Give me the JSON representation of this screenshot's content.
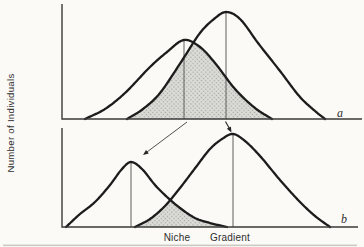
{
  "figure": {
    "y_axis_label": "Number of Individuals",
    "x_axis_words": [
      "Niche",
      "Gradient"
    ]
  },
  "colors": {
    "background": "#fbfaf7",
    "curve": "#1c1c1c",
    "axis": "#3a3a3a",
    "peak_line": "#4f4f4f",
    "shade_base": "#dcdcd8",
    "shade_dot": "#a6a6a0",
    "arrow": "#262626",
    "text": "#2e2e2e",
    "scan_edge": "#97958f"
  },
  "chart_data": [
    {
      "panel_label": "a",
      "type": "area",
      "xlabel": "Niche Gradient",
      "ylabel": "Number of Individuals",
      "axis_ticks": "none (qualitative axes)",
      "axes": {
        "x": 62,
        "y_top": 4,
        "baseline": 119,
        "x_end": 362
      },
      "series": [
        {
          "name": "species-1-curve",
          "points": [
            [
              85,
              0
            ],
            [
              105,
              10
            ],
            [
              125,
              26
            ],
            [
              150,
              52
            ],
            [
              167,
              67
            ],
            [
              184,
              79
            ],
            [
              200,
              72
            ],
            [
              215,
              56
            ],
            [
              235,
              30
            ],
            [
              255,
              11
            ],
            [
              272,
              0
            ]
          ],
          "peak": [
            184,
            79
          ]
        },
        {
          "name": "species-2-curve",
          "points": [
            [
              127,
              0
            ],
            [
              143,
              10
            ],
            [
              160,
              26
            ],
            [
              183,
              60
            ],
            [
              200,
              86
            ],
            [
              214,
              100
            ],
            [
              226,
              107
            ],
            [
              240,
              100
            ],
            [
              258,
              76
            ],
            [
              280,
              48
            ],
            [
              300,
              22
            ],
            [
              315,
              8
            ],
            [
              325,
              0
            ]
          ],
          "peak": [
            226,
            107
          ]
        }
      ],
      "overlap_shaded": true,
      "label_pos": [
        337,
        117
      ]
    },
    {
      "panel_label": "b",
      "type": "area",
      "xlabel": "Niche Gradient",
      "ylabel": "Number of Individuals",
      "axis_ticks": "none (qualitative axes)",
      "axes": {
        "x": 62,
        "y_top": 128,
        "baseline": 227,
        "x_end": 358
      },
      "series": [
        {
          "name": "species-1-curve",
          "points": [
            [
              66,
              0
            ],
            [
              80,
              13
            ],
            [
              95,
              25
            ],
            [
              110,
              42
            ],
            [
              122,
              58
            ],
            [
              131,
              65
            ],
            [
              142,
              58
            ],
            [
              155,
              42
            ],
            [
              167,
              30
            ],
            [
              180,
              19
            ],
            [
              195,
              9
            ],
            [
              210,
              4
            ],
            [
              227,
              0
            ]
          ],
          "peak": [
            131,
            65
          ]
        },
        {
          "name": "species-2-curve",
          "points": [
            [
              135,
              0
            ],
            [
              150,
              8
            ],
            [
              165,
              21
            ],
            [
              180,
              39
            ],
            [
              196,
              60
            ],
            [
              210,
              78
            ],
            [
              222,
              88
            ],
            [
              233,
              93
            ],
            [
              245,
              86
            ],
            [
              260,
              71
            ],
            [
              280,
              47
            ],
            [
              300,
              25
            ],
            [
              315,
              11
            ],
            [
              330,
              0
            ]
          ],
          "peak": [
            233,
            93
          ]
        }
      ],
      "overlap_shaded": true,
      "label_pos": [
        341,
        223
      ]
    }
  ],
  "arrows": [
    {
      "name": "shift-arrow-left-species",
      "from": [
        187,
        122
      ],
      "to": [
        143,
        155
      ],
      "width": 0.8,
      "head": 5.5
    },
    {
      "name": "shift-arrow-right-species",
      "from": [
        225.5,
        121.5
      ],
      "to": [
        231.5,
        132.5
      ],
      "width": 1.1,
      "head": 5.5
    }
  ]
}
